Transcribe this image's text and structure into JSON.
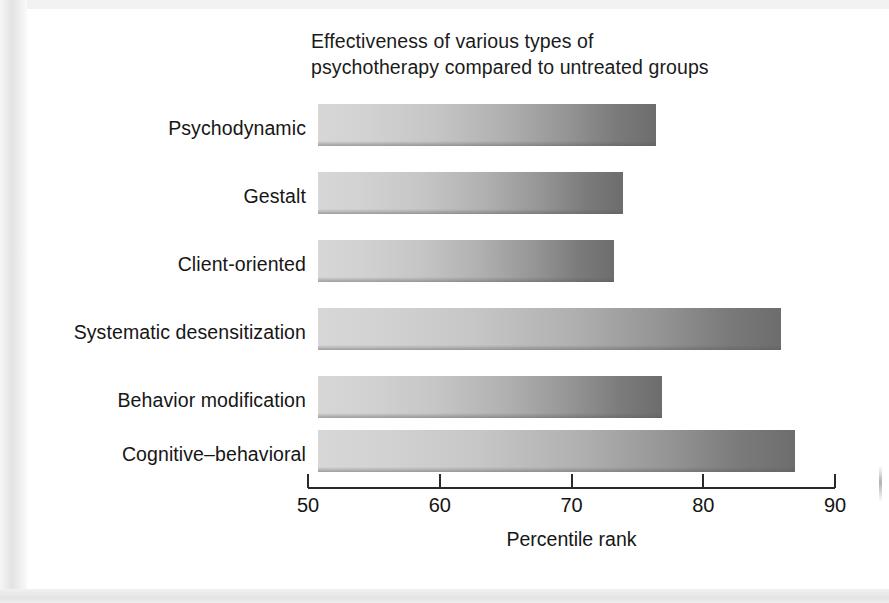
{
  "page": {
    "background_color": "#ffffff",
    "surround_color": "#e9e9e9"
  },
  "chart_data": {
    "type": "bar",
    "orientation": "horizontal",
    "title": "Effectiveness of various types of psychotherapy compared to untreated groups",
    "title_lines": [
      "Effectiveness of various types of",
      "psychotherapy compared to untreated groups"
    ],
    "categories": [
      "Psychodynamic",
      "Gestalt",
      "Client-oriented",
      "Systematic desensitization",
      "Behavior modification",
      "Cognitive–behavioral"
    ],
    "values": [
      76.4,
      73.9,
      73.2,
      85.9,
      76.9,
      87.0
    ],
    "xlabel": "Percentile rank",
    "ylabel": "",
    "xlim": [
      50,
      90
    ],
    "xticks": [
      50,
      60,
      70,
      80,
      90
    ],
    "xtick_labels": [
      "50",
      "60",
      "70",
      "80",
      "90"
    ],
    "grid": false,
    "legend": false,
    "bar_gradient_from": "#d7d7d7",
    "bar_gradient_to": "#6d6d6d",
    "axis_color": "#2a2a2a"
  }
}
